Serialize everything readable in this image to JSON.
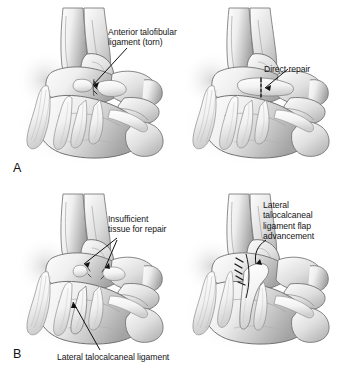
{
  "figure": {
    "type": "medical-illustration",
    "background_color": "#ffffff",
    "ink_color": "#141414"
  },
  "panels": [
    {
      "id": "A",
      "letter": "A",
      "views": [
        {
          "id": "A-left",
          "caption": "torn anterior talofibular ligament",
          "label": {
            "text": "Anterior talofibular\nligament (torn)",
            "lines": [
              "Anterior talofibular",
              "ligament (torn)"
            ]
          }
        },
        {
          "id": "A-right",
          "caption": "direct suture repair of the ligament",
          "label": {
            "text": "Direct repair",
            "lines": [
              "Direct repair"
            ]
          }
        }
      ]
    },
    {
      "id": "B",
      "letter": "B",
      "views": [
        {
          "id": "B-left",
          "caption": "insufficient remaining ligament tissue",
          "label": {
            "text": "Insufficient\ntissue for repair",
            "lines": [
              "Insufficient",
              "tissue for repair"
            ]
          },
          "secondary_label": {
            "text": "Lateral talocalcaneal ligament",
            "lines": [
              "Lateral talocalcaneal ligament"
            ]
          }
        },
        {
          "id": "B-right",
          "caption": "talocalcaneal ligament flap advanced and sutured",
          "label": {
            "text": "Lateral\ntalocalcaneal\nligament flap\nadvancement",
            "lines": [
              "Lateral",
              "talocalcaneal",
              "ligament flap",
              "advancement"
            ]
          }
        }
      ]
    }
  ]
}
